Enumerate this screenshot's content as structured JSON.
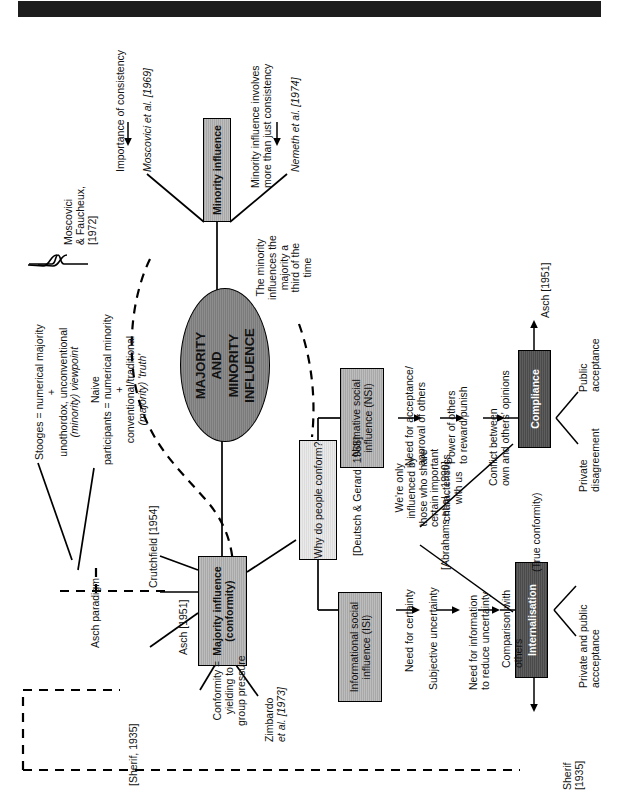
{
  "document": {
    "title": "Majority and Minority Influence mind map",
    "orientation": "rotated-90-ccw",
    "header_bar_color": "#1d1d1d"
  },
  "central_node": {
    "label_line1": "MAJORITY",
    "label_line2": "AND",
    "label_line3": "MINORITY",
    "label_line4": "INFLUENCE"
  },
  "nodes": {
    "minority_influence": "Minority influence",
    "majority_influence_line1": "Majority influence",
    "majority_influence_line2": "(conformity)",
    "why_conform": "Why do people conform?",
    "nsi_line1": "Normative social",
    "nsi_line2": "influence (NSI)",
    "isi_line1": "Informational social",
    "isi_line2": "influence (ISI)",
    "compliance": "Compliance",
    "internalisation": "Internalisation"
  },
  "minority_branch": {
    "moscovici_cite": "Moscovici et al. [1969]",
    "moscovici_outcome": "Importance of consistency",
    "nemeth_cite": "Nemeth et al. [1974]",
    "nemeth_outcome_line1": "Minority influence involves",
    "nemeth_outcome_line2": "more than just consistency",
    "third_of_time_line1": "The minority",
    "third_of_time_line2": "influences the",
    "third_of_time_line3": "majority a",
    "third_of_time_line4": "third of the",
    "third_of_time_line5": "time"
  },
  "moscovici_faucheux": {
    "cite_line1": "Moscovici",
    "cite_line2": "& Faucheux,",
    "cite_line3": "[1972]",
    "stooges_line1": "Stooges = numerical majority",
    "stooges_line2": "+",
    "stooges_line3": "unothordox, unconventional",
    "stooges_line4": "(minority) viewpoint",
    "naive_line1": "Naive",
    "naive_line2": "participants = numerical minority",
    "naive_line3": "+",
    "naive_line4": "conventional/traditional",
    "naive_line5": "(majority) 'truth'"
  },
  "majority_branch": {
    "asch_paradigm": "Asch paradigm",
    "crutchfield": "Crutchfield [1954]",
    "asch_1951_left": "Asch [1951]",
    "sherif_1935_left": "[Sherif, 1935]",
    "conformity_def_line1": "Conformity =",
    "conformity_def_line2": "yielding to",
    "conformity_def_line3": "group pressure",
    "zimbardo_line1": "Zimbardo",
    "zimbardo_line2": "et al. [1973]",
    "deutsch_gerard": "[Deutsch & Gerard, 1955]"
  },
  "nsi_chain": {
    "step1_line1": "Need for acceptance/",
    "step1_line2": "approval of others",
    "step2_line1": "Power of others",
    "step2_line2": "to reward/punish",
    "step3_line1": "Conflict between",
    "step3_line2": "own and others' opinions",
    "outcome_public_line1": "Public",
    "outcome_public_line2": "acceptance",
    "outcome_private_line1": "Private",
    "outcome_private_line2": "disagreement",
    "asch_1951_right": "Asch [1951]"
  },
  "isi_chain": {
    "step1": "Need for certainty",
    "step2": "Subjective uncertainty",
    "step3_line1": "Need for information",
    "step3_line2": "to reduce uncertainty",
    "step4_line1": "Comparison with",
    "step4_line2": "others",
    "outcome_line1": "Private and public",
    "outcome_line2": "accceptance",
    "true_conformity": "(True conformity)",
    "sherif_line1": "Sherif",
    "sherif_line2": "[1935]"
  },
  "abrahams": {
    "line1": "We're only",
    "line2": "influenced by",
    "line3": "those who share",
    "line4": "certain important",
    "line5": "characteristics",
    "line6": "with us",
    "cite": "[Abrahams et al., 1990]"
  }
}
